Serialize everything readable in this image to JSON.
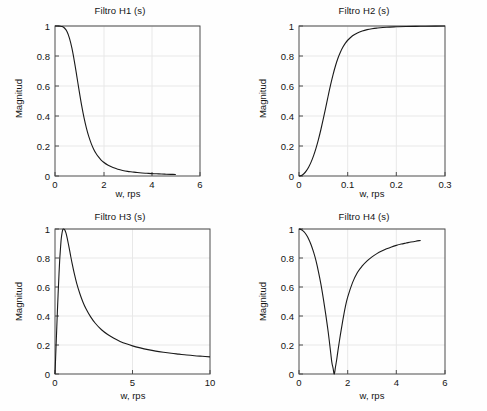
{
  "figure": {
    "background": "#fefefe",
    "axis_color": "#4d4d4d",
    "grid_color": "#e8e8e8",
    "line_color": "#1a1a1a"
  },
  "chart_data": [
    {
      "type": "line",
      "id": "H1",
      "title": "Filtro H1 (s)",
      "xlabel": "w, rps",
      "ylabel": "Magnitud",
      "xlim": [
        0,
        6
      ],
      "ylim": [
        0,
        1
      ],
      "xticks": [
        0,
        2,
        4,
        6
      ],
      "xticklabels": [
        "0",
        "2",
        "4",
        "6"
      ],
      "yticks": [
        0,
        0.2,
        0.4,
        0.6,
        0.8,
        1
      ],
      "yticklabels": [
        "0",
        "0.2",
        "0.4",
        "0.6",
        "0.8",
        "1"
      ],
      "grid": true,
      "legend": "none",
      "series": [
        {
          "name": "H1 magnitude",
          "x": [
            0,
            0.1,
            0.2,
            0.3,
            0.4,
            0.5,
            0.6,
            0.7,
            0.8,
            0.9,
            1.0,
            1.1,
            1.2,
            1.3,
            1.4,
            1.5,
            1.6,
            1.7,
            1.8,
            1.9,
            2.0,
            2.2,
            2.4,
            2.6,
            2.8,
            3.0,
            3.2,
            3.4,
            3.6,
            3.8,
            4.0,
            4.2,
            4.4,
            4.6,
            4.8,
            5.0
          ],
          "y": [
            1.0,
            1.0,
            0.999,
            0.996,
            0.985,
            0.962,
            0.918,
            0.852,
            0.766,
            0.668,
            0.567,
            0.472,
            0.389,
            0.319,
            0.262,
            0.216,
            0.179,
            0.15,
            0.127,
            0.108,
            0.093,
            0.071,
            0.056,
            0.045,
            0.037,
            0.031,
            0.027,
            0.023,
            0.02,
            0.018,
            0.016,
            0.015,
            0.013,
            0.012,
            0.011,
            0.01
          ]
        }
      ]
    },
    {
      "type": "line",
      "id": "H2",
      "title": "Filtro H2 (s)",
      "xlabel": "w, rps",
      "ylabel": "Magnitud",
      "xlim": [
        0,
        0.3
      ],
      "ylim": [
        0,
        1
      ],
      "xticks": [
        0,
        0.1,
        0.2,
        0.3
      ],
      "xticklabels": [
        "0",
        "0.1",
        "0.2",
        "0.3"
      ],
      "yticks": [
        0,
        0.2,
        0.4,
        0.6,
        0.8,
        1
      ],
      "yticklabels": [
        "0",
        "0.2",
        "0.4",
        "0.6",
        "0.8",
        "1"
      ],
      "grid": true,
      "legend": "none",
      "series": [
        {
          "name": "H2 magnitude",
          "x": [
            0,
            0.005,
            0.01,
            0.015,
            0.02,
            0.025,
            0.03,
            0.035,
            0.04,
            0.045,
            0.05,
            0.055,
            0.06,
            0.065,
            0.07,
            0.075,
            0.08,
            0.085,
            0.09,
            0.095,
            0.1,
            0.11,
            0.12,
            0.13,
            0.14,
            0.15,
            0.16,
            0.18,
            0.2,
            0.22,
            0.25,
            0.28,
            0.3
          ],
          "y": [
            0.0,
            0.004,
            0.015,
            0.034,
            0.06,
            0.094,
            0.136,
            0.186,
            0.244,
            0.31,
            0.382,
            0.458,
            0.535,
            0.609,
            0.676,
            0.735,
            0.785,
            0.825,
            0.858,
            0.884,
            0.905,
            0.935,
            0.954,
            0.967,
            0.976,
            0.982,
            0.986,
            0.992,
            0.995,
            0.997,
            0.998,
            0.999,
            1.0
          ]
        }
      ]
    },
    {
      "type": "line",
      "id": "H3",
      "title": "Filtro H3 (s)",
      "xlabel": "w, rps",
      "ylabel": "Magnitud",
      "xlim": [
        0,
        10
      ],
      "ylim": [
        0,
        1
      ],
      "xticks": [
        0,
        5,
        10
      ],
      "xticklabels": [
        "0",
        "5",
        "10"
      ],
      "yticks": [
        0,
        0.2,
        0.4,
        0.6,
        0.8,
        1
      ],
      "yticklabels": [
        "0",
        "0.2",
        "0.4",
        "0.6",
        "0.8",
        "1"
      ],
      "grid": true,
      "legend": "none",
      "series": [
        {
          "name": "H3 magnitude",
          "x": [
            0,
            0.05,
            0.1,
            0.15,
            0.2,
            0.25,
            0.3,
            0.35,
            0.4,
            0.45,
            0.5,
            0.55,
            0.6,
            0.65,
            0.7,
            0.75,
            0.8,
            0.9,
            1.0,
            1.1,
            1.25,
            1.4,
            1.6,
            1.8,
            2.0,
            2.3,
            2.6,
            3.0,
            3.4,
            3.8,
            4.2,
            4.6,
            5.0,
            5.5,
            6.0,
            6.5,
            7.0,
            7.5,
            8.0,
            8.5,
            9.0,
            9.5,
            10.0
          ],
          "y": [
            0.0,
            0.14,
            0.28,
            0.42,
            0.55,
            0.67,
            0.78,
            0.86,
            0.93,
            0.97,
            0.995,
            1.0,
            0.998,
            0.99,
            0.975,
            0.955,
            0.93,
            0.877,
            0.82,
            0.765,
            0.69,
            0.625,
            0.555,
            0.497,
            0.45,
            0.394,
            0.35,
            0.305,
            0.272,
            0.246,
            0.225,
            0.208,
            0.194,
            0.18,
            0.168,
            0.158,
            0.15,
            0.143,
            0.137,
            0.131,
            0.126,
            0.122,
            0.118
          ]
        }
      ]
    },
    {
      "type": "line",
      "id": "H4",
      "title": "Filtro H4 (s)",
      "xlabel": "w, rps",
      "ylabel": "Magnitud",
      "xlim": [
        0,
        6
      ],
      "ylim": [
        0,
        1
      ],
      "xticks": [
        0,
        2,
        4,
        6
      ],
      "xticklabels": [
        "0",
        "2",
        "4",
        "6"
      ],
      "yticks": [
        0,
        0.2,
        0.4,
        0.6,
        0.8,
        1
      ],
      "yticklabels": [
        "0",
        "0.2",
        "0.4",
        "0.6",
        "0.8",
        "1"
      ],
      "grid": true,
      "legend": "none",
      "series": [
        {
          "name": "H4 magnitude",
          "x": [
            0,
            0.1,
            0.2,
            0.3,
            0.4,
            0.5,
            0.6,
            0.7,
            0.8,
            0.9,
            1.0,
            1.1,
            1.2,
            1.3,
            1.35,
            1.4,
            1.45,
            1.5,
            1.55,
            1.6,
            1.7,
            1.8,
            1.9,
            2.0,
            2.2,
            2.4,
            2.6,
            2.8,
            3.0,
            3.2,
            3.4,
            3.6,
            3.8,
            4.0,
            4.2,
            4.4,
            4.6,
            4.8,
            5.0
          ],
          "y": [
            1.0,
            0.995,
            0.982,
            0.96,
            0.93,
            0.89,
            0.84,
            0.78,
            0.705,
            0.62,
            0.52,
            0.41,
            0.29,
            0.15,
            0.08,
            0.04,
            0.0,
            0.05,
            0.1,
            0.16,
            0.27,
            0.37,
            0.46,
            0.53,
            0.63,
            0.7,
            0.745,
            0.78,
            0.808,
            0.83,
            0.848,
            0.863,
            0.876,
            0.887,
            0.896,
            0.903,
            0.91,
            0.916,
            0.921
          ]
        }
      ]
    }
  ]
}
